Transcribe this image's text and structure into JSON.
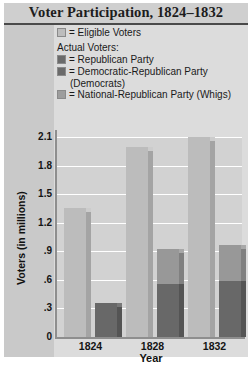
{
  "title": "Voter Participation, 1824–1832",
  "legend": {
    "eligible": "= Eligible Voters",
    "actual_header": "Actual Voters:",
    "republican": "= Republican Party",
    "dem_republican": "= Democratic-Republican Party",
    "dem_republican_second": "(Democrats)",
    "nat_republican": "= National-Republican Party (Whigs)"
  },
  "colors": {
    "title_band": "#cfcfcf",
    "plot_bg": "#d2d2d2",
    "eligible": "#bcbcbc",
    "national_republican": "#989898",
    "democratic_republican": "#686868",
    "republican": "#686868",
    "gridline": "#ffffff",
    "axis": "#8e8e8e"
  },
  "chart_data": {
    "type": "bar",
    "title": "Voter Participation, 1824–1832",
    "xlabel": "Year",
    "ylabel": "Voters (in millions)",
    "categories": [
      "1824",
      "1828",
      "1832"
    ],
    "yticks": [
      "0",
      ".3",
      ".6",
      ".9",
      "1.2",
      "1.5",
      "1.8",
      "2.1"
    ],
    "ytick_values": [
      0,
      0.3,
      0.6,
      0.9,
      1.2,
      1.5,
      1.8,
      2.1
    ],
    "ylim": [
      0,
      2.1
    ],
    "grid": true,
    "legend_position": "top",
    "series": [
      {
        "name": "Eligible Voters",
        "color": "#bcbcbc",
        "values": [
          1.35,
          2.0,
          2.1
        ]
      },
      {
        "name": "Republican Party",
        "color": "#686868",
        "values": [
          0.36,
          null,
          null
        ]
      },
      {
        "name": "Democratic-Republican Party (Democrats)",
        "color": "#686868",
        "values": [
          null,
          0.56,
          0.59
        ]
      },
      {
        "name": "National-Republican Party (Whigs)",
        "color": "#989898",
        "values": [
          null,
          0.36,
          0.38
        ]
      }
    ]
  }
}
